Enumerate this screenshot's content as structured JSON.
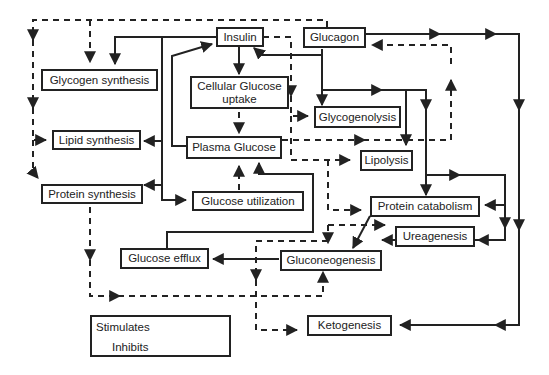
{
  "diagram": {
    "nodes": {
      "insulin": "Insulin",
      "glucagon": "Glucagon",
      "glycogen_synthesis": "Glycogen synthesis",
      "cellular_glucose_uptake_1": "Cellular Glucose",
      "cellular_glucose_uptake_2": "uptake",
      "glycogenolysis": "Glycogenolysis",
      "lipid_synthesis": "Lipid synthesis",
      "plasma_glucose": "Plasma Glucose",
      "lipolysis": "Lipolysis",
      "protein_synthesis": "Protein synthesis",
      "glucose_utilization": "Glucose utilization",
      "protein_catabolism": "Protein catabolism",
      "ureagenesis": "Ureagenesis",
      "glucose_efflux": "Glucose efflux",
      "gluconeogenesis": "Gluconeogenesis",
      "ketogenesis": "Ketogenesis"
    },
    "legend": {
      "stimulates": "Stimulates",
      "inhibits": "Inhibits"
    },
    "edges": [
      {
        "from": "Insulin",
        "to": "Glycogen synthesis",
        "type": "stimulates"
      },
      {
        "from": "Insulin",
        "to": "Lipid synthesis",
        "type": "stimulates"
      },
      {
        "from": "Insulin",
        "to": "Protein synthesis",
        "type": "stimulates"
      },
      {
        "from": "Insulin",
        "to": "Glucose utilization",
        "type": "stimulates"
      },
      {
        "from": "Insulin",
        "to": "Cellular Glucose uptake",
        "type": "stimulates"
      },
      {
        "from": "Insulin",
        "to": "Glycogenolysis",
        "type": "inhibits"
      },
      {
        "from": "Insulin",
        "to": "Lipolysis",
        "type": "inhibits"
      },
      {
        "from": "Insulin",
        "to": "Protein catabolism",
        "type": "inhibits"
      },
      {
        "from": "Insulin",
        "to": "Ureagenesis",
        "type": "inhibits"
      },
      {
        "from": "Insulin",
        "to": "Gluconeogenesis",
        "type": "inhibits"
      },
      {
        "from": "Insulin",
        "to": "Ketogenesis",
        "type": "inhibits"
      },
      {
        "from": "Cellular Glucose uptake",
        "to": "Plasma Glucose",
        "type": "inhibits"
      },
      {
        "from": "Glucose utilization",
        "to": "Plasma Glucose",
        "type": "inhibits"
      },
      {
        "from": "Plasma Glucose",
        "to": "Insulin",
        "type": "stimulates"
      },
      {
        "from": "Plasma Glucose",
        "to": "Glucagon",
        "type": "inhibits"
      },
      {
        "from": "Glucagon",
        "to": "Insulin",
        "type": "stimulates"
      },
      {
        "from": "Glucagon",
        "to": "Glycogenolysis",
        "type": "stimulates"
      },
      {
        "from": "Glucagon",
        "to": "Lipolysis",
        "type": "stimulates"
      },
      {
        "from": "Glucagon",
        "to": "Protein catabolism",
        "type": "stimulates"
      },
      {
        "from": "Glucagon",
        "to": "Ureagenesis",
        "type": "stimulates"
      },
      {
        "from": "Glucagon",
        "to": "Gluconeogenesis",
        "type": "stimulates"
      },
      {
        "from": "Glucagon",
        "to": "Ketogenesis",
        "type": "stimulates"
      },
      {
        "from": "Glucagon",
        "to": "Glycogen synthesis",
        "type": "inhibits"
      },
      {
        "from": "Glucagon",
        "to": "Lipid synthesis",
        "type": "inhibits"
      },
      {
        "from": "Glucagon",
        "to": "Protein synthesis",
        "type": "inhibits"
      },
      {
        "from": "Protein catabolism",
        "to": "Gluconeogenesis",
        "type": "stimulates"
      },
      {
        "from": "Gluconeogenesis",
        "to": "Glucose efflux",
        "type": "stimulates"
      },
      {
        "from": "Glucose efflux",
        "to": "Plasma Glucose",
        "type": "stimulates"
      },
      {
        "from": "Protein synthesis",
        "to": "Gluconeogenesis",
        "type": "inhibits"
      }
    ]
  }
}
